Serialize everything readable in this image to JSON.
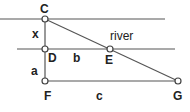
{
  "diagram": {
    "colors": {
      "line": "#555555",
      "text": "#222222",
      "point_fill": "#ffffff"
    },
    "region_label": "river",
    "points": {
      "C": {
        "label": "C",
        "x": 45,
        "y": 19
      },
      "D": {
        "label": "D",
        "x": 45,
        "y": 49
      },
      "E": {
        "label": "E",
        "x": 110,
        "y": 49
      },
      "F": {
        "label": "F",
        "x": 45,
        "y": 81
      },
      "G": {
        "label": "G",
        "x": 178,
        "y": 81
      }
    },
    "segments": {
      "x": {
        "label": "x",
        "from": "C",
        "to": "D"
      },
      "a": {
        "label": "a",
        "from": "D",
        "to": "F"
      },
      "b": {
        "label": "b",
        "from": "D",
        "to": "E"
      },
      "c": {
        "label": "c",
        "from": "F",
        "to": "G"
      }
    },
    "lines": [
      {
        "name": "far-bank",
        "x1": 0,
        "y1": 19,
        "x2": 165,
        "y2": 19
      },
      {
        "name": "near-bank",
        "x1": 17,
        "y1": 49,
        "x2": 175,
        "y2": 49
      },
      {
        "name": "baseline-FG",
        "x1": 45,
        "y1": 81,
        "x2": 178,
        "y2": 81
      },
      {
        "name": "vertical-CF",
        "x1": 45,
        "y1": 19,
        "x2": 45,
        "y2": 81
      },
      {
        "name": "sightline-CG",
        "x1": 45,
        "y1": 19,
        "x2": 178,
        "y2": 81
      }
    ]
  }
}
